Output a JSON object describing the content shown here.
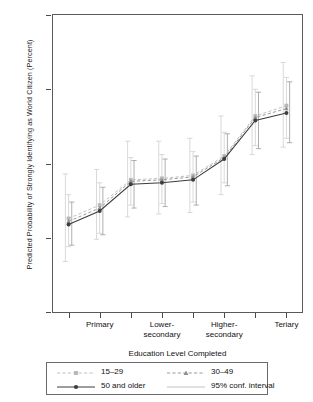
{
  "chart_data": {
    "type": "line",
    "title": "",
    "xlabel": "Education Level Completed",
    "ylabel": "Predicted Probability of Strongly Identifying as World Citizen (Percent)",
    "ylim": [
      10,
      30
    ],
    "yticks": [
      10,
      15,
      20,
      25,
      30
    ],
    "grid": false,
    "legend_position": "bottom",
    "x": [
      1,
      2,
      3,
      4,
      5,
      6,
      7,
      8
    ],
    "categories": [
      "",
      "Primary",
      "",
      "Lower-secondary",
      "",
      "Higher-secondary",
      "",
      "Teriary"
    ],
    "xtick_labels": [
      {
        "index": 1,
        "line1": "Primary",
        "line2": ""
      },
      {
        "index": 3,
        "line1": "Lower-",
        "line2": "secondary"
      },
      {
        "index": 5,
        "line1": "Higher-",
        "line2": "secondary"
      },
      {
        "index": 7,
        "line1": "Teriary",
        "line2": ""
      }
    ],
    "series": [
      {
        "name": "15–29",
        "style": "dashed",
        "marker": "square",
        "color": "#b9b9b9",
        "values": [
          16.3,
          17.2,
          18.9,
          19.0,
          19.2,
          20.5,
          23.2,
          23.9
        ],
        "ci_low": [
          13.4,
          14.9,
          16.4,
          16.6,
          16.7,
          17.9,
          20.6,
          21.1
        ],
        "ci_high": [
          19.3,
          19.6,
          21.5,
          21.5,
          21.7,
          23.2,
          25.9,
          26.8
        ]
      },
      {
        "name": "30–49",
        "style": "dashed",
        "marker": "triangle",
        "color": "#8f8f8f",
        "values": [
          16.1,
          17.0,
          18.8,
          18.9,
          19.1,
          20.4,
          23.1,
          23.7
        ],
        "ci_low": [
          14.4,
          15.3,
          17.2,
          17.3,
          17.4,
          18.7,
          21.2,
          21.7
        ],
        "ci_high": [
          17.9,
          18.7,
          20.4,
          20.6,
          20.8,
          22.1,
          25.0,
          25.8
        ]
      },
      {
        "name": "50 and older",
        "style": "solid",
        "marker": "circle",
        "color": "#3d3d3d",
        "values": [
          15.9,
          16.8,
          18.6,
          18.7,
          18.9,
          20.3,
          22.9,
          23.4
        ],
        "ci_low": [
          14.5,
          15.2,
          17.0,
          17.1,
          17.2,
          18.5,
          21.0,
          21.4
        ],
        "ci_high": [
          17.4,
          18.4,
          20.2,
          20.3,
          20.5,
          22.0,
          24.8,
          25.5
        ]
      }
    ],
    "legend": [
      {
        "label": "15–29",
        "marker": "square",
        "style": "dashed",
        "color": "#b9b9b9"
      },
      {
        "label": "30–49",
        "marker": "triangle",
        "style": "dashed",
        "color": "#8f8f8f"
      },
      {
        "label": "50 and older",
        "marker": "circle",
        "style": "solid",
        "color": "#3d3d3d"
      },
      {
        "label": "95% conf. interval",
        "marker": "none",
        "style": "solid",
        "color": "#c2c2c2"
      }
    ]
  }
}
